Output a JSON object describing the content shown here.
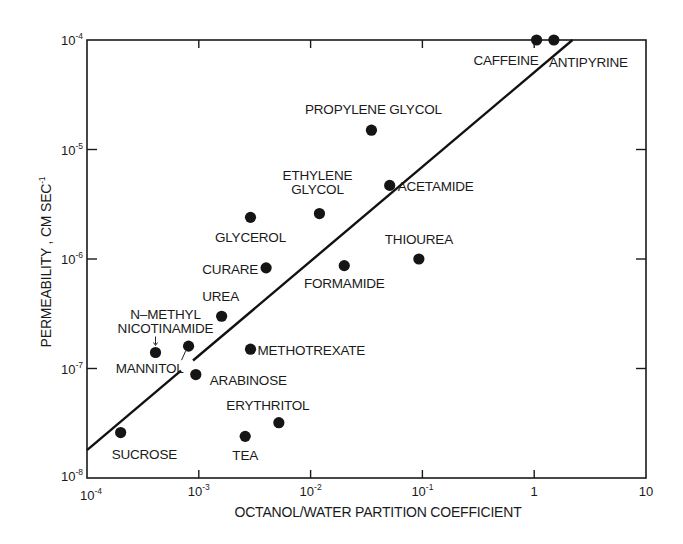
{
  "chart_data": {
    "type": "scatter",
    "title": "",
    "xlabel": "OCTANOL/WATER PARTITION COEFFICIENT",
    "ylabel": "PERMEABILITY , CM SEC",
    "ylabel_superscript": "-1",
    "xscale": "log",
    "yscale": "log",
    "xlim": [
      0.0001,
      10
    ],
    "ylim": [
      1e-08,
      0.0001
    ],
    "grid": false,
    "legend": null,
    "x_ticks": [
      {
        "base": "10",
        "exp": "-4",
        "value": 0.0001
      },
      {
        "base": "10",
        "exp": "-3",
        "value": 0.001
      },
      {
        "base": "10",
        "exp": "-2",
        "value": 0.01
      },
      {
        "base": "10",
        "exp": "-1",
        "value": 0.1
      },
      {
        "base": "1",
        "exp": "",
        "value": 1
      },
      {
        "base": "10",
        "exp": "",
        "value": 10
      }
    ],
    "y_ticks": [
      {
        "base": "10",
        "exp": "-4",
        "value": 0.0001
      },
      {
        "base": "10",
        "exp": "-5",
        "value": 1e-05
      },
      {
        "base": "10",
        "exp": "-6",
        "value": 1e-06
      },
      {
        "base": "10",
        "exp": "-7",
        "value": 1e-07
      },
      {
        "base": "10",
        "exp": "-8",
        "value": 1e-08
      }
    ],
    "points": [
      {
        "name": "CAFFEINE",
        "x": 1.05,
        "y": 0.0001
      },
      {
        "name": "ANTIPYRINE",
        "x": 1.5,
        "y": 0.0001
      },
      {
        "name": "PROPYLENE GLYCOL",
        "x": 0.035,
        "y": 1.5e-05
      },
      {
        "name": "ACETAMIDE",
        "x": 0.051,
        "y": 4.7e-06
      },
      {
        "name": "ETHYLENE GLYCOL",
        "x": 0.012,
        "y": 2.6e-06
      },
      {
        "name": "GLYCEROL",
        "x": 0.0029,
        "y": 2.4e-06
      },
      {
        "name": "THIOUREA",
        "x": 0.093,
        "y": 1e-06
      },
      {
        "name": "CURARE",
        "x": 0.004,
        "y": 8.3e-07
      },
      {
        "name": "FORMAMIDE",
        "x": 0.02,
        "y": 8.7e-07
      },
      {
        "name": "UREA",
        "x": 0.0016,
        "y": 3e-07
      },
      {
        "name": "N-METHYL NICOTINAMIDE",
        "x": 0.00041,
        "y": 1.4e-07
      },
      {
        "name": "MANNITOL",
        "x": 0.00081,
        "y": 1.6e-07
      },
      {
        "name": "METHOTREXATE",
        "x": 0.0029,
        "y": 1.5e-07
      },
      {
        "name": "ARABINOSE",
        "x": 0.00094,
        "y": 8.8e-08
      },
      {
        "name": "ERYTHRITOL",
        "x": 0.0052,
        "y": 3.2e-08
      },
      {
        "name": "TEA",
        "x": 0.0026,
        "y": 2.4e-08
      },
      {
        "name": "SUCROSE",
        "x": 0.0002,
        "y": 2.6e-08
      }
    ],
    "fit_line": {
      "type": "linear-in-log-log",
      "start": {
        "x": 0.0001,
        "y": 1.8e-08
      },
      "end": {
        "x": 2.2,
        "y": 0.0001
      },
      "gap_near": "MANNITOL"
    }
  },
  "labels": {
    "CAFFEINE": {
      "lines": [
        "CAFFEINE"
      ],
      "anchor": "end",
      "dx": 2,
      "dy": 25
    },
    "ANTIPYRINE": {
      "lines": [
        "ANTIPYRINE"
      ],
      "anchor": "start",
      "dx": -5,
      "dy": 27
    },
    "PROPYLENE GLYCOL": {
      "lines": [
        "PROPYLENE GLYCOL"
      ],
      "anchor": "middle",
      "dx": 2,
      "dy": -16
    },
    "ACETAMIDE": {
      "lines": [
        "ACETAMIDE"
      ],
      "anchor": "start",
      "dx": 8,
      "dy": 6
    },
    "ETHYLENE GLYCOL": {
      "lines": [
        "ETHYLENE",
        "GLYCOL"
      ],
      "anchor": "middle",
      "dx": -2,
      "dy": -34
    },
    "GLYCEROL": {
      "lines": [
        "GLYCEROL"
      ],
      "anchor": "middle",
      "dx": 0,
      "dy": 25
    },
    "THIOUREA": {
      "lines": [
        "THIOUREA"
      ],
      "anchor": "middle",
      "dx": 0,
      "dy": -15
    },
    "CURARE": {
      "lines": [
        "CURARE"
      ],
      "anchor": "end",
      "dx": -8,
      "dy": 6
    },
    "FORMAMIDE": {
      "lines": [
        "FORMAMIDE"
      ],
      "anchor": "middle",
      "dx": 0,
      "dy": 22
    },
    "UREA": {
      "lines": [
        "UREA"
      ],
      "anchor": "middle",
      "dx": -1,
      "dy": -15
    },
    "N-METHYL NICOTINAMIDE": {
      "lines": [
        "N–METHYL",
        "NICOTINAMIDE"
      ],
      "anchor": "middle",
      "dx": 10,
      "dy": -33
    },
    "MANNITOL": {
      "lines": [
        "MANNITOL"
      ],
      "anchor": "end",
      "dx": -5,
      "dy": 27
    },
    "METHOTREXATE": {
      "lines": [
        "METHOTREXATE"
      ],
      "anchor": "start",
      "dx": 7,
      "dy": 6
    },
    "ARABINOSE": {
      "lines": [
        "ARABINOSE"
      ],
      "anchor": "start",
      "dx": 14,
      "dy": 10
    },
    "ERYTHRITOL": {
      "lines": [
        "ERYTHRITOL"
      ],
      "anchor": "middle",
      "dx": -11,
      "dy": -13
    },
    "TEA": {
      "lines": [
        "TEA"
      ],
      "anchor": "middle",
      "dx": 0,
      "dy": 24
    },
    "SUCROSE": {
      "lines": [
        "SUCROSE"
      ],
      "anchor": "start",
      "dx": -9,
      "dy": 26
    }
  },
  "colors": {
    "ink": "#151515",
    "background": "#ffffff"
  }
}
